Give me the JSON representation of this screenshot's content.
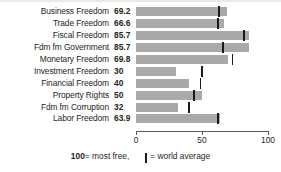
{
  "chart_data": {
    "type": "bar",
    "orientation": "horizontal",
    "title": "",
    "xlabel": "",
    "ylabel": "",
    "xlim": [
      0,
      100
    ],
    "xticks": [
      0,
      50,
      100
    ],
    "xtick_labels": [
      "0",
      "50",
      "100"
    ],
    "grid": false,
    "legend_position": "bottom",
    "categories": [
      "Business Freedom",
      "Trade Freedom",
      "Fiscal Freedom",
      "Fdm fm Government",
      "Monetary Freedom",
      "Investment Freedom",
      "Financial Freedom",
      "Property Rights",
      "Fdm fm Corruption",
      "Labor Freedom"
    ],
    "values": [
      69.2,
      66.6,
      85.7,
      85.7,
      69.8,
      30,
      40,
      50,
      32,
      63.9
    ],
    "value_labels": [
      "69.2",
      "66.6",
      "85.7",
      "85.7",
      "69.8",
      "30",
      "40",
      "50",
      "32",
      "63.9"
    ],
    "series": [
      {
        "name": "Country score",
        "values": [
          69.2,
          66.6,
          85.7,
          85.7,
          69.8,
          30,
          40,
          50,
          32,
          63.9
        ],
        "color": "#a9a9a9"
      },
      {
        "name": "World average",
        "marker": "vertical-tick",
        "values": [
          63,
          62,
          82,
          66,
          73,
          50,
          49,
          44,
          40,
          62
        ],
        "color": "#1a1a1a"
      }
    ],
    "bar_color": "#a9a9a9",
    "marker_color": "#1a1a1a"
  },
  "rows": [
    {
      "label": "Business Freedom",
      "value": "69.2",
      "value_num": 69.2,
      "avg": 63
    },
    {
      "label": "Trade Freedom",
      "value": "66.6",
      "value_num": 66.6,
      "avg": 62
    },
    {
      "label": "Fiscal Freedom",
      "value": "85.7",
      "value_num": 85.7,
      "avg": 82
    },
    {
      "label": "Fdm fm Government",
      "value": "85.7",
      "value_num": 85.7,
      "avg": 66
    },
    {
      "label": "Monetary Freedom",
      "value": "69.8",
      "value_num": 69.8,
      "avg": 73
    },
    {
      "label": "Investment Freedom",
      "value": "30",
      "value_num": 30,
      "avg": 50
    },
    {
      "label": "Financial Freedom",
      "value": "40",
      "value_num": 40,
      "avg": 49
    },
    {
      "label": "Property Rights",
      "value": "50",
      "value_num": 50,
      "avg": 44
    },
    {
      "label": "Fdm fm Corruption",
      "value": "32",
      "value_num": 32,
      "avg": 40
    },
    {
      "label": "Labor Freedom",
      "value": "63.9",
      "value_num": 63.9,
      "avg": 62
    }
  ],
  "axis": {
    "ticks": [
      {
        "label": "0",
        "value": 0
      },
      {
        "label": "50",
        "value": 50
      },
      {
        "label": "100",
        "value": 100
      }
    ]
  },
  "legend": {
    "most_free_number": "100",
    "most_free_text": " = most free,",
    "world_average_text": " = world average"
  }
}
